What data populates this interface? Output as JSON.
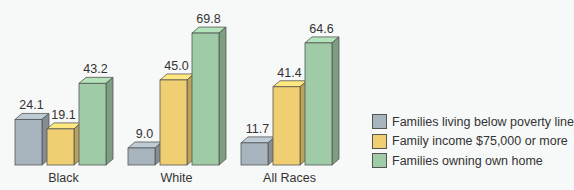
{
  "chart_data": {
    "type": "bar",
    "title": "",
    "xlabel": "",
    "ylabel": "",
    "categories": [
      "Black",
      "White",
      "All Races"
    ],
    "series": [
      {
        "name": "Families living below poverty line",
        "color": "#a9b5be",
        "values": [
          24.1,
          9.0,
          11.7
        ]
      },
      {
        "name": "Family income $75,000 or more",
        "color": "#f0cf72",
        "values": [
          19.1,
          45.0,
          41.4
        ]
      },
      {
        "name": "Families owning own home",
        "color": "#9fcba6",
        "values": [
          43.2,
          69.8,
          64.6
        ]
      }
    ],
    "value_labels": [
      [
        "24.1",
        "9.0",
        "11.7"
      ],
      [
        "19.1",
        "45.0",
        "41.4"
      ],
      [
        "43.2",
        "69.8",
        "64.6"
      ]
    ],
    "ylim": [
      0,
      75
    ],
    "grid": false,
    "legend_position": "right",
    "style": "3d-bar"
  },
  "legend": {
    "items": [
      {
        "label": "Families living below poverty line",
        "color": "#a9b5be"
      },
      {
        "label": "Family income $75,000 or more",
        "color": "#f0cf72"
      },
      {
        "label": "Families owning own home",
        "color": "#9fcba6"
      }
    ]
  }
}
